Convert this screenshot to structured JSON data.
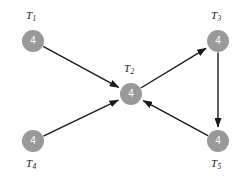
{
  "diagram": {
    "type": "directed-graph",
    "background_color": "#ffffff",
    "node_fill_color": "#999999",
    "node_text_color": "#ffffff",
    "edge_color": "#1a1a1a",
    "label_color": "#1a1a1a",
    "nodes": [
      {
        "id": "T1",
        "label_text": "T",
        "label_sub": "1",
        "value": "4",
        "cx": 33,
        "cy": 41,
        "r": 11,
        "label_x": 26,
        "label_y": 10
      },
      {
        "id": "T2",
        "label_text": "T",
        "label_sub": "2",
        "value": "4",
        "cx": 131,
        "cy": 94,
        "r": 11,
        "label_x": 124,
        "label_y": 63
      },
      {
        "id": "T3",
        "label_text": "T",
        "label_sub": "3",
        "value": "4",
        "cx": 218,
        "cy": 41,
        "r": 11,
        "label_x": 211,
        "label_y": 10
      },
      {
        "id": "T4",
        "label_text": "T",
        "label_sub": "4",
        "value": "4",
        "cx": 33,
        "cy": 141,
        "r": 11,
        "label_x": 26,
        "label_y": 158
      },
      {
        "id": "T5",
        "label_text": "T",
        "label_sub": "5",
        "value": "4",
        "cx": 218,
        "cy": 141,
        "r": 11,
        "label_x": 211,
        "label_y": 158
      }
    ],
    "edges": [
      {
        "from": "T1",
        "to": "T2",
        "name": "edge-t1-t2"
      },
      {
        "from": "T4",
        "to": "T2",
        "name": "edge-t4-t2"
      },
      {
        "from": "T2",
        "to": "T3",
        "name": "edge-t2-t3"
      },
      {
        "from": "T3",
        "to": "T5",
        "name": "edge-t3-t5"
      },
      {
        "from": "T5",
        "to": "T2",
        "name": "edge-t5-t2"
      }
    ]
  }
}
